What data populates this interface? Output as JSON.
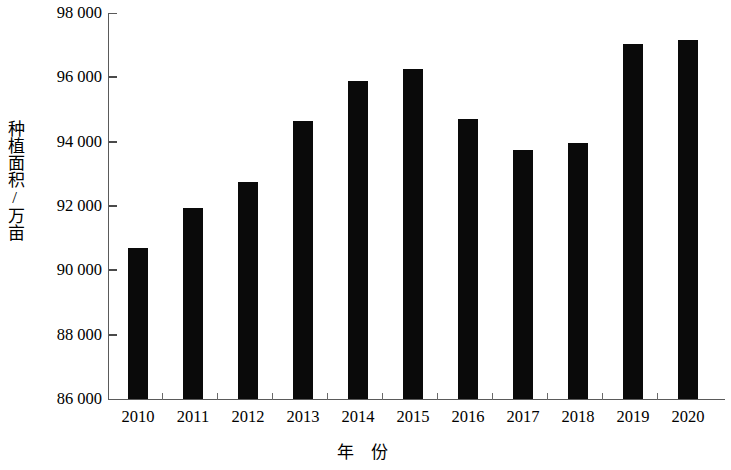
{
  "chart_data": {
    "type": "bar",
    "title": "",
    "subtitle": "",
    "xlabel": "年 份",
    "ylabel": "种植面积/万亩",
    "categories": [
      "2010",
      "2011",
      "2012",
      "2013",
      "2014",
      "2015",
      "2016",
      "2017",
      "2018",
      "2019",
      "2020"
    ],
    "values": [
      90700,
      91950,
      92750,
      94650,
      95900,
      96250,
      94700,
      93750,
      93950,
      97050,
      97150
    ],
    "series": [
      {
        "name": "种植面积",
        "values": [
          90700,
          91950,
          92750,
          94650,
          95900,
          96250,
          94700,
          93750,
          93950,
          97050,
          97150
        ]
      }
    ],
    "ylim": [
      86000,
      98000
    ],
    "ytick_values": [
      86000,
      88000,
      90000,
      92000,
      94000,
      96000,
      98000
    ],
    "ytick_labels": [
      "86 000",
      "88 000",
      "90 000",
      "92 000",
      "94 000",
      "96 000",
      "98 000"
    ],
    "ytick_step": 2000,
    "xtick_labels": [
      "2010",
      "2011",
      "2012",
      "2013",
      "2014",
      "2015",
      "2016",
      "2017",
      "2018",
      "2019",
      "2020"
    ],
    "grid": false,
    "legend": false,
    "legend_position": "none",
    "bar_color": "#0a0a0a",
    "axis_color": "#5a5a5a",
    "background_color": "#ffffff"
  },
  "axes": {
    "y_title": "种植面积/万亩",
    "x_title_chars": [
      "年",
      "份"
    ]
  }
}
